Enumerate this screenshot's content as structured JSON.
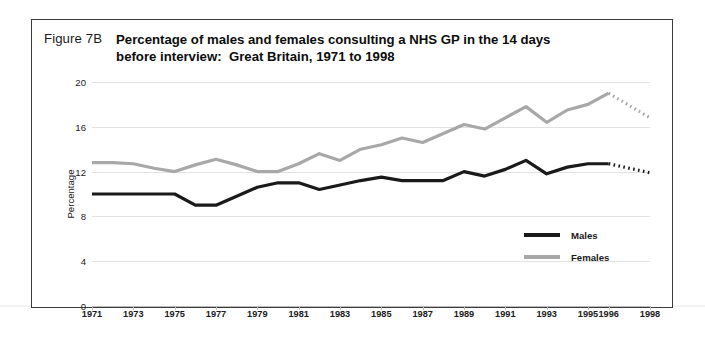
{
  "figure": {
    "label": "Figure 7B",
    "title_line1": "Percentage of males and females consulting a NHS GP in the 14 days",
    "title_line2": "before interview:  Great Britain, 1971 to 1998"
  },
  "colors": {
    "males": "#1a1a1a",
    "females": "#a8a8a8",
    "gridline": "#e2e2e2",
    "border": "#3a3a3a"
  },
  "legend": {
    "position": "inside-bottom-right",
    "entries": [
      {
        "label": "Males",
        "color": "#1a1a1a"
      },
      {
        "label": "Females",
        "color": "#a8a8a8"
      }
    ]
  },
  "chart_data": {
    "type": "line",
    "title": "Percentage of males and females consulting a NHS GP in the 14 days before interview:  Great Britain, 1971 to 1998",
    "xlabel": "",
    "ylabel": "Percentage",
    "ylim": [
      0,
      20
    ],
    "yticks": [
      0,
      4,
      8,
      12,
      16,
      20
    ],
    "grid": true,
    "xtick_labels": [
      "1971",
      "1973",
      "1975",
      "1977",
      "1979",
      "1981",
      "1983",
      "1985",
      "1987",
      "1989",
      "1991",
      "1993",
      "1995",
      "1996",
      "1998"
    ],
    "x": [
      1971,
      1972,
      1973,
      1974,
      1975,
      1976,
      1977,
      1978,
      1979,
      1980,
      1981,
      1982,
      1983,
      1984,
      1985,
      1986,
      1987,
      1988,
      1989,
      1990,
      1991,
      1992,
      1993,
      1994,
      1995,
      1996,
      1998
    ],
    "series": [
      {
        "name": "Males",
        "color": "#1a1a1a",
        "values": [
          10.0,
          10.0,
          10.0,
          10.0,
          10.0,
          9.0,
          9.0,
          9.8,
          10.6,
          11.0,
          11.0,
          10.4,
          10.8,
          11.2,
          11.5,
          11.2,
          11.2,
          11.2,
          12.0,
          11.6,
          12.2,
          13.0,
          11.8,
          12.4,
          12.7,
          12.7,
          11.9
        ],
        "dashed_from": 1996
      },
      {
        "name": "Females",
        "color": "#a8a8a8",
        "values": [
          12.8,
          12.8,
          12.7,
          12.3,
          12.0,
          12.6,
          13.1,
          12.6,
          12.0,
          12.0,
          12.7,
          13.6,
          13.0,
          14.0,
          14.4,
          15.0,
          14.6,
          15.4,
          16.2,
          15.8,
          16.8,
          17.8,
          16.4,
          17.5,
          18.0,
          19.0,
          16.8
        ],
        "dashed_from": 1996
      }
    ],
    "note": "Final segment (1996 to 1998) shown dotted for both series"
  }
}
